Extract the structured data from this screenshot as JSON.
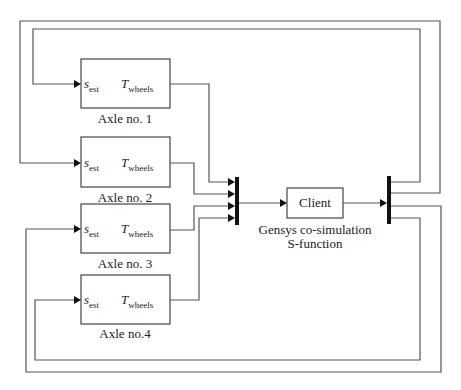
{
  "diagram": {
    "blocks": [
      {
        "id": "axle1",
        "label": "Axle no. 1",
        "input_port": "s",
        "input_sub": "est",
        "output_port": "T",
        "output_sub": "wheels"
      },
      {
        "id": "axle2",
        "label": "Axle no. 2",
        "input_port": "s",
        "input_sub": "est",
        "output_port": "T",
        "output_sub": "wheels"
      },
      {
        "id": "axle3",
        "label": "Axle no. 3",
        "input_port": "s",
        "input_sub": "est",
        "output_port": "T",
        "output_sub": "wheels"
      },
      {
        "id": "axle4",
        "label": "Axle no.4",
        "input_port": "s",
        "input_sub": "est",
        "output_port": "T",
        "output_sub": "wheels"
      }
    ],
    "client": {
      "label": "Client",
      "caption_line1": "Gensys co-simulation",
      "caption_line2": "S-function"
    },
    "mux": {
      "inputs": 4
    },
    "demux": {
      "outputs": 4
    },
    "colors": {
      "wire": "#555555",
      "bar": "#111111",
      "box_border": "#444444"
    }
  }
}
